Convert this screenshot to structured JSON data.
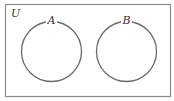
{
  "diagram": {
    "type": "venn",
    "universe_label": "U",
    "sets": [
      {
        "label": "A",
        "cx": 51.5,
        "cy": 51.5,
        "r": 30
      },
      {
        "label": "B",
        "cx": 126.5,
        "cy": 51.5,
        "r": 30
      }
    ],
    "overlap": false,
    "colors": {
      "frame": "#8a8a8a",
      "circle": "#6a6a6a",
      "text": "#333333"
    }
  }
}
